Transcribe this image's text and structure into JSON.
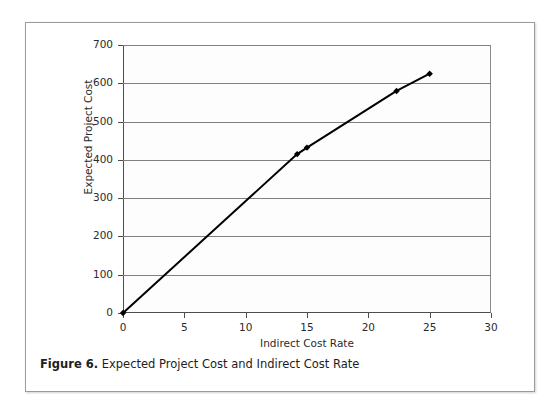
{
  "figure": {
    "caption_number": "Figure 6.",
    "caption_text": "Expected Project Cost and Indirect Cost Rate"
  },
  "chart_data": {
    "type": "line",
    "title": "",
    "xlabel": "Indirect Cost Rate",
    "ylabel": "Expected Project Cost",
    "xlim": [
      0,
      30
    ],
    "ylim": [
      0,
      700
    ],
    "xticks": [
      0,
      5,
      10,
      15,
      20,
      25,
      30
    ],
    "yticks": [
      0,
      100,
      200,
      300,
      400,
      500,
      600,
      700
    ],
    "grid": "horizontal",
    "legend": "none",
    "marker": "diamond",
    "line_color": "#000000",
    "line_width": 2,
    "series": [
      {
        "name": "Expected Project Cost",
        "x": [
          0,
          14.2,
          15.0,
          22.3,
          25.0
        ],
        "values": [
          0,
          415,
          432,
          580,
          625
        ]
      }
    ]
  }
}
